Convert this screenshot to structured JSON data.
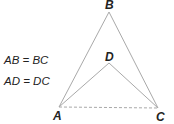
{
  "diagram": {
    "points": {
      "A": {
        "label": "A",
        "x": 59,
        "y": 107
      },
      "B": {
        "label": "B",
        "x": 109,
        "y": 12
      },
      "C": {
        "label": "C",
        "x": 158,
        "y": 108
      },
      "D": {
        "label": "D",
        "x": 109,
        "y": 63
      }
    },
    "segments": [
      {
        "from": "A",
        "to": "B",
        "style": "solid"
      },
      {
        "from": "B",
        "to": "C",
        "style": "solid"
      },
      {
        "from": "A",
        "to": "D",
        "style": "solid"
      },
      {
        "from": "D",
        "to": "C",
        "style": "solid"
      },
      {
        "from": "A",
        "to": "C",
        "style": "dashed"
      }
    ],
    "line_color": "#a9a9a9",
    "givens": [
      "AB = BC",
      "AD = DC"
    ]
  }
}
